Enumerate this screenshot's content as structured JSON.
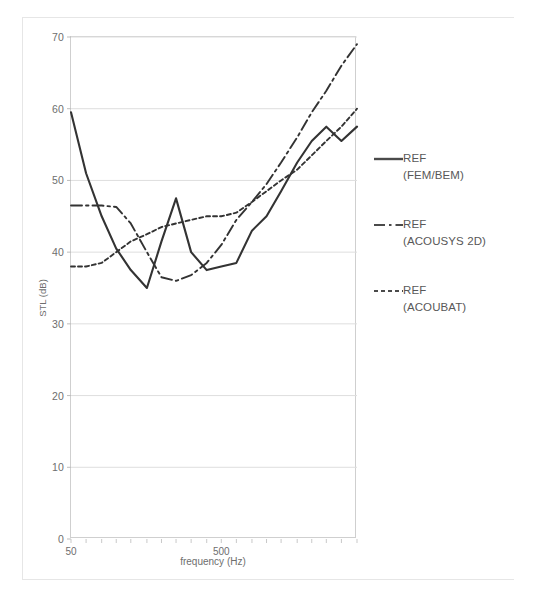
{
  "chart_data": {
    "type": "line",
    "title": "",
    "xlabel": "frequency (Hz)",
    "ylabel": "STL (dB)",
    "xscale": "log",
    "xlim": [
      50,
      4000
    ],
    "ylim": [
      0,
      70
    ],
    "ytick_labels": [
      "0",
      "10",
      "20",
      "30",
      "40",
      "50",
      "60",
      "70"
    ],
    "ytick_values": [
      0,
      10,
      20,
      30,
      40,
      50,
      60,
      70
    ],
    "xtick_labels": [
      "50",
      "500"
    ],
    "xtick_values": [
      50,
      500
    ],
    "grid": "horizontal",
    "legend_position": "right",
    "x": [
      50,
      63,
      80,
      100,
      125,
      160,
      200,
      250,
      315,
      400,
      500,
      630,
      800,
      1000,
      1250,
      1600,
      2000,
      2500,
      3150,
      4000
    ],
    "series": [
      {
        "name": "REF (FEM/BEM)",
        "style": "solid",
        "color": "#333333",
        "values": [
          59.5,
          51.0,
          45.0,
          40.5,
          37.5,
          35.0,
          41.5,
          47.5,
          40.0,
          37.5,
          38.0,
          38.5,
          43.0,
          45.0,
          48.5,
          52.5,
          55.5,
          57.5,
          55.5,
          57.5
        ]
      },
      {
        "name": "REF (ACOUSYS 2D)",
        "style": "dashdot",
        "color": "#333333",
        "values": [
          46.5,
          46.5,
          46.5,
          46.3,
          44.0,
          40.0,
          36.5,
          36.0,
          36.8,
          38.5,
          41.0,
          44.5,
          47.0,
          49.5,
          52.5,
          56.0,
          59.5,
          62.5,
          66.0,
          69.0
        ]
      },
      {
        "name": "REF (ACOUBAT)",
        "style": "dotted",
        "color": "#333333",
        "values": [
          38.0,
          38.0,
          38.5,
          40.0,
          41.5,
          42.5,
          43.5,
          44.0,
          44.5,
          45.0,
          45.0,
          45.5,
          47.0,
          48.5,
          50.0,
          51.5,
          53.5,
          55.5,
          57.5,
          60.0
        ]
      }
    ]
  },
  "legend": {
    "items": [
      {
        "label": "REF",
        "sub": "(FEM/BEM)",
        "style": "solid"
      },
      {
        "label": "REF",
        "sub": "(ACOUSYS 2D)",
        "style": "dashdot"
      },
      {
        "label": "REF",
        "sub": "(ACOUBAT)",
        "style": "dotted"
      }
    ]
  }
}
